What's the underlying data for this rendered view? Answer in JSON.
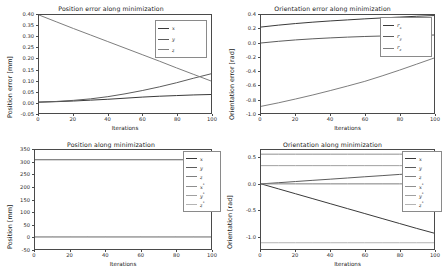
{
  "figure": {
    "width": 443,
    "height": 273,
    "background": "#ffffff",
    "panel_count": 4
  },
  "colors": {
    "series_x": "#3a3a3a",
    "series_y": "#5c5c5c",
    "series_z": "#7e7e7e",
    "series_x_star": "#8f8f8f",
    "series_y_star": "#a0a0a0",
    "series_z_star": "#b4b4b4",
    "axis": "#4a4a4a",
    "text": "#1a1a1a",
    "legend_border": "#8a8a8a"
  },
  "chart_data": [
    {
      "id": "position-error",
      "type": "line",
      "title": "Position error along minimization",
      "xlabel": "Iterations",
      "ylabel": "Position error  [mm]",
      "xlim": [
        0,
        100
      ],
      "ylim": [
        -0.05,
        0.4
      ],
      "xticks": [
        "0",
        "20",
        "40",
        "60",
        "80",
        "100"
      ],
      "xtick_values": [
        0,
        20,
        40,
        60,
        80,
        100
      ],
      "yticks": [
        "0.40",
        "0.35",
        "0.30",
        "0.25",
        "0.20",
        "0.15",
        "0.10",
        "0.05",
        "0.00",
        "-0.05"
      ],
      "ytick_values": [
        0.4,
        0.35,
        0.3,
        0.25,
        0.2,
        0.15,
        0.1,
        0.05,
        0.0,
        -0.05
      ],
      "grid": false,
      "legend_position": "upper right",
      "x": [
        0,
        10,
        20,
        30,
        40,
        50,
        60,
        70,
        80,
        90,
        100
      ],
      "series": [
        {
          "name": "x",
          "color": "#3a3a3a",
          "values": [
            0.0,
            0.002,
            0.005,
            0.009,
            0.013,
            0.018,
            0.023,
            0.027,
            0.03,
            0.033,
            0.035
          ]
        },
        {
          "name": "y",
          "color": "#5c5c5c",
          "values": [
            0.0,
            0.003,
            0.008,
            0.015,
            0.025,
            0.038,
            0.053,
            0.07,
            0.089,
            0.11,
            0.13
          ]
        },
        {
          "name": "z",
          "color": "#7e7e7e",
          "values": [
            0.4,
            0.369,
            0.338,
            0.308,
            0.278,
            0.248,
            0.218,
            0.188,
            0.157,
            0.127,
            0.097
          ]
        }
      ]
    },
    {
      "id": "orientation-error",
      "type": "line",
      "title": "Orientation error along minimization",
      "xlabel": "Iterations",
      "ylabel": "Orientation error  [rad]",
      "xlim": [
        0,
        100
      ],
      "ylim": [
        -1.0,
        0.4
      ],
      "xticks": [
        "0",
        "20",
        "40",
        "60",
        "80",
        "100"
      ],
      "xtick_values": [
        0,
        20,
        40,
        60,
        80,
        100
      ],
      "yticks": [
        "0.4",
        "0.2",
        "0.0",
        "-0.2",
        "-0.4",
        "-0.6",
        "-0.8",
        "-1.0"
      ],
      "ytick_values": [
        0.4,
        0.2,
        0.0,
        -0.2,
        -0.4,
        -0.6,
        -0.8,
        -1.0
      ],
      "grid": false,
      "legend_position": "upper right",
      "x": [
        0,
        10,
        20,
        30,
        40,
        50,
        60,
        70,
        80,
        90,
        100
      ],
      "series": [
        {
          "name": "r_x",
          "color": "#3a3a3a",
          "values": [
            0.228,
            0.255,
            0.278,
            0.298,
            0.315,
            0.33,
            0.345,
            0.358,
            0.37,
            0.382,
            0.392
          ]
        },
        {
          "name": "r_y",
          "color": "#5c5c5c",
          "values": [
            0.0,
            0.024,
            0.044,
            0.06,
            0.073,
            0.084,
            0.093,
            0.1,
            0.106,
            0.11,
            0.114
          ]
        },
        {
          "name": "r_z",
          "color": "#7e7e7e",
          "values": [
            -0.905,
            -0.855,
            -0.8,
            -0.742,
            -0.68,
            -0.615,
            -0.548,
            -0.47,
            -0.388,
            -0.302,
            -0.215
          ]
        }
      ]
    },
    {
      "id": "position",
      "type": "line",
      "title": "Position along minimization",
      "xlabel": "Iterations",
      "ylabel": "Position  [mm]",
      "xlim": [
        0,
        100
      ],
      "ylim": [
        -50,
        350
      ],
      "xticks": [
        "0",
        "20",
        "40",
        "60",
        "80",
        "100"
      ],
      "xtick_values": [
        0,
        20,
        40,
        60,
        80,
        100
      ],
      "yticks": [
        "350",
        "300",
        "250",
        "200",
        "150",
        "100",
        "50",
        "0",
        "-50"
      ],
      "ytick_values": [
        350,
        300,
        250,
        200,
        150,
        100,
        50,
        0,
        -50
      ],
      "grid": false,
      "legend_position": "upper right",
      "x": [
        0,
        10,
        20,
        30,
        40,
        50,
        60,
        70,
        80,
        90,
        100
      ],
      "series": [
        {
          "name": "x",
          "color": "#3a3a3a",
          "values": [
            311,
            311,
            311,
            311,
            311,
            311,
            311,
            311,
            311,
            311,
            311
          ]
        },
        {
          "name": "y",
          "color": "#5c5c5c",
          "values": [
            0,
            0,
            0,
            0,
            0,
            0,
            0,
            0,
            0,
            0,
            0
          ]
        },
        {
          "name": "z",
          "color": "#7e7e7e",
          "values": [
            -1,
            -1,
            -1,
            -1,
            -1,
            -1,
            -1,
            -1,
            -1,
            -1,
            -1
          ]
        },
        {
          "name": "x*",
          "color": "#8f8f8f",
          "values": [
            311,
            311,
            311,
            311,
            311,
            311,
            311,
            311,
            311,
            311,
            311
          ]
        },
        {
          "name": "y*",
          "color": "#a0a0a0",
          "values": [
            0,
            0,
            0,
            0,
            0,
            0,
            0,
            0,
            0,
            0,
            0
          ]
        },
        {
          "name": "z*",
          "color": "#b4b4b4",
          "values": [
            -1,
            -1,
            -1,
            -1,
            -1,
            -1,
            -1,
            -1,
            -1,
            -1,
            -1
          ]
        }
      ]
    },
    {
      "id": "orientation",
      "type": "line",
      "title": "Orientation along minimization",
      "xlabel": "Iterations",
      "ylabel": "Orientation  [rad]",
      "xlim": [
        0,
        100
      ],
      "ylim": [
        -1.25,
        0.65
      ],
      "xticks": [
        "0",
        "20",
        "40",
        "60",
        "80",
        "100"
      ],
      "xtick_values": [
        0,
        20,
        40,
        60,
        80,
        100
      ],
      "yticks": [
        "0.5",
        "0.0",
        "-0.5",
        "-1.0"
      ],
      "ytick_values": [
        0.5,
        0.0,
        -0.5,
        -1.0
      ],
      "grid": false,
      "legend_position": "upper right",
      "x": [
        0,
        10,
        20,
        30,
        40,
        50,
        60,
        70,
        80,
        90,
        100
      ],
      "series": [
        {
          "name": "x",
          "color": "#3a3a3a",
          "values": [
            0.0,
            -0.095,
            -0.19,
            -0.285,
            -0.38,
            -0.475,
            -0.57,
            -0.665,
            -0.76,
            -0.855,
            -0.945
          ]
        },
        {
          "name": "y",
          "color": "#5c5c5c",
          "values": [
            0.0,
            0.022,
            0.045,
            0.068,
            0.09,
            0.113,
            0.136,
            0.158,
            0.181,
            0.2,
            0.215
          ]
        },
        {
          "name": "z",
          "color": "#7e7e7e",
          "values": [
            0.0,
            0.0,
            0.0,
            0.0,
            0.0,
            0.0,
            0.0,
            0.0,
            0.0,
            0.0,
            0.0
          ]
        },
        {
          "name": "x*",
          "color": "#8f8f8f",
          "values": [
            0.57,
            0.57,
            0.57,
            0.57,
            0.57,
            0.57,
            0.57,
            0.57,
            0.57,
            0.57,
            0.57
          ]
        },
        {
          "name": "y*",
          "color": "#a0a0a0",
          "values": [
            0.35,
            0.35,
            0.35,
            0.35,
            0.35,
            0.35,
            0.35,
            0.35,
            0.35,
            0.35,
            0.35
          ]
        },
        {
          "name": "z*",
          "color": "#b4b4b4",
          "values": [
            -1.13,
            -1.13,
            -1.13,
            -1.13,
            -1.13,
            -1.13,
            -1.13,
            -1.13,
            -1.13,
            -1.13,
            -1.13
          ]
        }
      ]
    }
  ]
}
